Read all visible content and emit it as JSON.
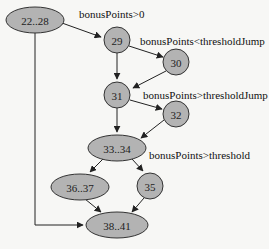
{
  "diagram": {
    "type": "control-flow-graph",
    "colors": {
      "background": "#f7f7f5",
      "node_fill": "#b3b3b3",
      "node_stroke": "#333333",
      "edge": "#222222"
    },
    "nodes": [
      {
        "id": "n22_28",
        "label": "22..28",
        "shape": "ellipse",
        "cx": 35,
        "cy": 20,
        "rx": 29,
        "ry": 13
      },
      {
        "id": "n29",
        "label": "29",
        "shape": "circle",
        "cx": 117,
        "cy": 40,
        "rx": 13,
        "ry": 13
      },
      {
        "id": "n30",
        "label": "30",
        "shape": "circle",
        "cx": 176,
        "cy": 62,
        "rx": 13,
        "ry": 13
      },
      {
        "id": "n31",
        "label": "31",
        "shape": "circle",
        "cx": 117,
        "cy": 95,
        "rx": 13,
        "ry": 13
      },
      {
        "id": "n32",
        "label": "32",
        "shape": "circle",
        "cx": 176,
        "cy": 114,
        "rx": 13,
        "ry": 13
      },
      {
        "id": "n33_34",
        "label": "33..34",
        "shape": "ellipse",
        "cx": 117,
        "cy": 148,
        "rx": 29,
        "ry": 13
      },
      {
        "id": "n36_37",
        "label": "36..37",
        "shape": "ellipse",
        "cx": 80,
        "cy": 187,
        "rx": 29,
        "ry": 13
      },
      {
        "id": "n35",
        "label": "35",
        "shape": "circle",
        "cx": 150,
        "cy": 186,
        "rx": 13,
        "ry": 13
      },
      {
        "id": "n38_41",
        "label": "38..41",
        "shape": "ellipse",
        "cx": 117,
        "cy": 225,
        "rx": 31,
        "ry": 13
      }
    ],
    "edges": [
      {
        "from": "22..28",
        "to": "29",
        "label": "bonusPoints>0",
        "path": "M62,23 L101,37",
        "lx": 79,
        "ly": 18
      },
      {
        "from": "29",
        "to": "30",
        "label": "bonusPoints<thresholdJump",
        "path": "M129,46 L163,57",
        "lx": 140,
        "ly": 45
      },
      {
        "from": "29",
        "to": "31",
        "label": "",
        "path": "M117,53 L117,79",
        "lx": 0,
        "ly": 0
      },
      {
        "from": "30",
        "to": "31",
        "label": "",
        "path": "M166,71 L133,88",
        "lx": 0,
        "ly": 0
      },
      {
        "from": "31",
        "to": "32",
        "label": "bonusPoints>thresholdJump",
        "path": "M130,100 L162,109",
        "lx": 143,
        "ly": 99
      },
      {
        "from": "31",
        "to": "33..34",
        "label": "",
        "path": "M117,108 L117,132",
        "lx": 0,
        "ly": 0
      },
      {
        "from": "32",
        "to": "33..34",
        "label": "",
        "path": "M164,120 L141,138",
        "lx": 0,
        "ly": 0
      },
      {
        "from": "33..34",
        "to": "36..37",
        "label": "",
        "path": "M103,159 L90,172",
        "lx": 0,
        "ly": 0
      },
      {
        "from": "33..34",
        "to": "35",
        "label": "bonusPoints>threshold",
        "path": "M132,159 L143,171",
        "lx": 149,
        "ly": 159
      },
      {
        "from": "36..37",
        "to": "38..41",
        "label": "",
        "path": "M85,199 L101,212",
        "lx": 0,
        "ly": 0
      },
      {
        "from": "35",
        "to": "38..41",
        "label": "",
        "path": "M144,198 L132,212",
        "lx": 0,
        "ly": 0
      },
      {
        "from": "22..28",
        "to": "38..41",
        "label": "",
        "path": "M35,33 L35,225 L83,225",
        "lx": 0,
        "ly": 0
      }
    ]
  }
}
